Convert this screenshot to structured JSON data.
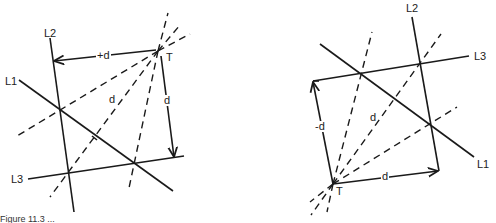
{
  "figure_left": {
    "labels": {
      "L1": "L1",
      "L2": "L2",
      "L3": "L3",
      "T": "T",
      "horizontal_offset": "+d",
      "dashed_distance": "d",
      "vertical_distance": "d"
    }
  },
  "figure_right": {
    "labels": {
      "L1": "L1",
      "L2": "L2",
      "L3": "L3",
      "T": "T",
      "vertical_offset": "-d",
      "dashed_distance": "d",
      "horizontal_distance": "d"
    }
  },
  "caption": "Figure 11.3 ..."
}
